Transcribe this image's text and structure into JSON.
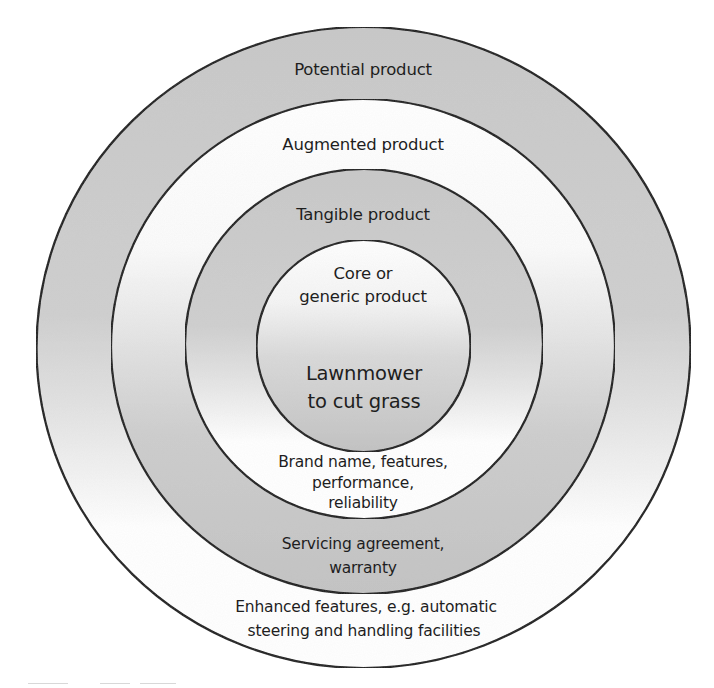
{
  "diagram": {
    "type": "concentric-rings",
    "colors": {
      "ring_stroke": "#111111",
      "shade_gray": "#c9c9c9",
      "shade_gray_dark": "#bdbdbd",
      "shade_white": "#ffffff",
      "text": "#1e1e1e"
    },
    "rings": [
      {
        "level": "potential",
        "label": "Potential product",
        "description": [
          "Enhanced features, e.g. automatic",
          "steering and handling facilities"
        ]
      },
      {
        "level": "augmented",
        "label": "Augmented product",
        "description": [
          "Servicing agreement,",
          "warranty"
        ]
      },
      {
        "level": "tangible",
        "label": "Tangible product",
        "description": [
          "Brand name, features,",
          "performance,",
          "reliability"
        ]
      },
      {
        "level": "core",
        "label": [
          "Core or",
          "generic product"
        ],
        "description": [
          "Lawnmower",
          "to cut grass"
        ]
      }
    ]
  }
}
